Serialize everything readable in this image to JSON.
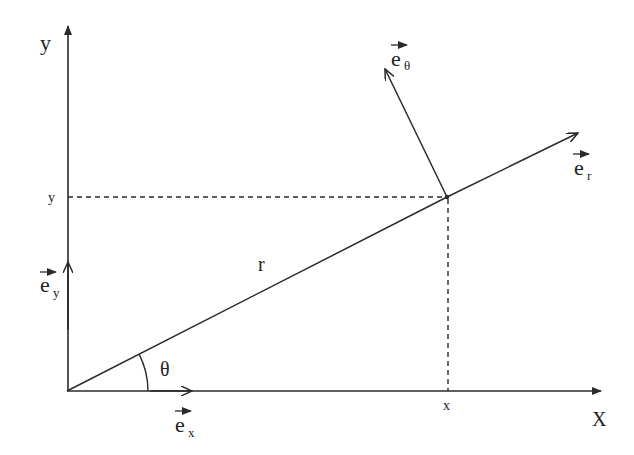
{
  "diagram": {
    "axes": {
      "x_label": "X",
      "y_label": "y"
    },
    "point": {
      "x_tick_label": "x",
      "y_tick_label": "y",
      "radius_label": "r",
      "angle_label": "θ"
    },
    "vectors": {
      "e_x": {
        "base": "e",
        "sub": "x"
      },
      "e_y": {
        "base": "e",
        "sub": "y"
      },
      "e_r": {
        "base": "e",
        "sub": "r"
      },
      "e_theta": {
        "base": "e",
        "sub": "θ"
      }
    },
    "colors": {
      "stroke": "#2a2a2a",
      "background": "#ffffff"
    }
  }
}
